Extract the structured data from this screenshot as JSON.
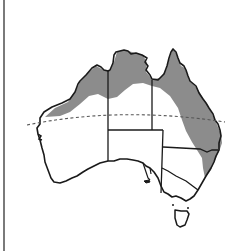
{
  "map": {
    "title": "",
    "region": "Australia",
    "colors": {
      "background": "#ffffff",
      "land": "#ffffff",
      "outline": "#1a1a1a",
      "distribution": "#8c8c8c",
      "tropic_line": "#555555",
      "frame_line": "#7a7a7a"
    },
    "layers": [
      {
        "name": "distribution-range",
        "description": "Shaded range across northern coast and eastern Queensland/NSW coast"
      },
      {
        "name": "tropic-of-capricorn",
        "style": "dashed"
      },
      {
        "name": "state-borders",
        "style": "solid"
      }
    ]
  }
}
